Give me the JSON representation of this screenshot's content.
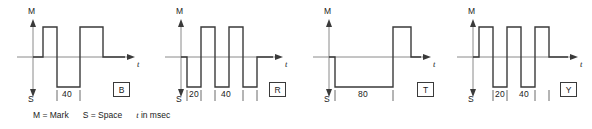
{
  "figure": {
    "caption": {
      "mark_text": "M = Mark",
      "space_text": "S = Space",
      "t_symbol": "t",
      "units_text": "in msec"
    },
    "axis_labels": {
      "mark": "M",
      "space": "S",
      "time": "t"
    },
    "panels": [
      {
        "code": "B",
        "duration_labels": [
          "40"
        ],
        "waveform": {
          "description": "mark pulse, space pulse of 40 ms, wide mark pulse",
          "segments": [
            {
              "level": "mark",
              "width": 14
            },
            {
              "level": "space",
              "width": 30
            },
            {
              "level": "mark",
              "width": 30
            }
          ]
        }
      },
      {
        "code": "R",
        "duration_labels": [
          "20",
          "40"
        ],
        "waveform": {
          "description": "space 20 ms, mark, space 40 ms, mark, space",
          "segments": [
            {
              "level": "space",
              "width": 14
            },
            {
              "level": "mark",
              "width": 14
            },
            {
              "level": "space",
              "width": 14
            },
            {
              "level": "mark",
              "width": 14
            },
            {
              "level": "space",
              "width": 14
            }
          ]
        }
      },
      {
        "code": "T",
        "duration_labels": [
          "80"
        ],
        "waveform": {
          "description": "space of 80 ms, then mark pulse",
          "segments": [
            {
              "level": "space",
              "width": 60
            },
            {
              "level": "mark",
              "width": 16
            }
          ]
        }
      },
      {
        "code": "Y",
        "duration_labels": [
          "20",
          "40"
        ],
        "waveform": {
          "description": "mark, space 20 ms, mark 40 ms, space 20 ms, mark",
          "segments": [
            {
              "level": "mark",
              "width": 14
            },
            {
              "level": "space",
              "width": 14
            },
            {
              "level": "mark",
              "width": 14
            },
            {
              "level": "space",
              "width": 14
            },
            {
              "level": "mark",
              "width": 14
            }
          ]
        }
      }
    ],
    "colors": {
      "stroke": "#3a3a3a",
      "baseline": "#8a8a8a",
      "text": "#1a1a1a",
      "background": "#ffffff"
    }
  }
}
